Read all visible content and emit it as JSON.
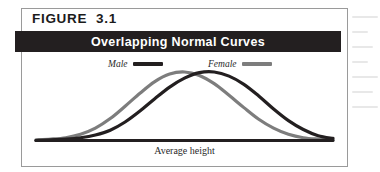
{
  "figure": {
    "label": "FIGURE  3.1",
    "title": "Overlapping Normal Curves",
    "axis_label": "Average height"
  },
  "legend": {
    "items": [
      {
        "label": "Male",
        "color": "#231f20"
      },
      {
        "label": "Female",
        "color": "#7d7d7d"
      }
    ]
  },
  "colors": {
    "title_bar": "#231f20",
    "frame_border": "#9a9a9a",
    "page_background": "#ffffff",
    "male_curve": "#231f20",
    "female_curve": "#7d7d7d",
    "baseline": "#231f20"
  },
  "chart_data": {
    "type": "line",
    "title": "Overlapping Normal Curves",
    "xlabel": "Average height",
    "ylabel": "",
    "grid": false,
    "legend_position": "top-center",
    "axis_ranges": {
      "xlim": [
        0,
        100
      ],
      "ylim": [
        0,
        100
      ]
    },
    "annotations": [
      "Two overlapping normal distributions; the Female curve peaks to the left of the Male curve"
    ],
    "x": [
      0,
      5,
      10,
      15,
      20,
      25,
      30,
      35,
      40,
      45,
      50,
      55,
      60,
      65,
      70,
      75,
      80,
      85,
      90,
      95,
      100
    ],
    "series": [
      {
        "name": "Female",
        "color": "#7d7d7d",
        "mean": 41,
        "values": [
          1,
          2,
          4,
          9,
          18,
          32,
          50,
          69,
          86,
          97,
          100,
          95,
          83,
          66,
          48,
          31,
          18,
          9,
          4,
          2,
          1
        ]
      },
      {
        "name": "Male",
        "color": "#231f20",
        "mean": 54,
        "values": [
          0,
          1,
          2,
          4,
          8,
          15,
          27,
          43,
          61,
          78,
          91,
          99,
          100,
          94,
          82,
          65,
          46,
          29,
          16,
          7,
          3
        ]
      }
    ]
  }
}
